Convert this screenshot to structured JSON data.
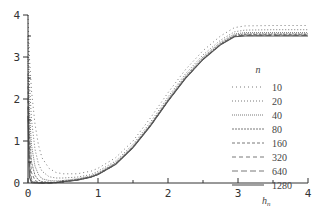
{
  "chart_data": {
    "type": "line",
    "title": "",
    "xlabel": "h_n",
    "ylabel": "",
    "xlim": [
      0,
      4
    ],
    "ylim": [
      0,
      4
    ],
    "xticks": [
      0,
      1,
      2,
      3,
      4
    ],
    "yticks": [
      0,
      1,
      2,
      3,
      4
    ],
    "xtick_labels": [
      "0",
      "1",
      "2",
      "3",
      "4"
    ],
    "ytick_labels": [
      "0",
      "1",
      "2",
      "3",
      "4"
    ],
    "minor_ticks": true,
    "grid": false,
    "legend": {
      "title": "n",
      "position": "right-center"
    },
    "x": [
      0.0,
      0.02,
      0.05,
      0.1,
      0.15,
      0.2,
      0.3,
      0.4,
      0.5,
      0.7,
      0.9,
      1.0,
      1.25,
      1.5,
      1.75,
      2.0,
      2.25,
      2.5,
      2.75,
      2.95,
      3.1,
      3.5,
      4.0
    ],
    "series": [
      {
        "name": "10",
        "dash": "1,3",
        "values": [
          4.0,
          3.0,
          2.2,
          1.4,
          0.9,
          0.6,
          0.35,
          0.25,
          0.22,
          0.22,
          0.28,
          0.35,
          0.6,
          1.0,
          1.55,
          2.15,
          2.7,
          3.15,
          3.5,
          3.7,
          3.74,
          3.75,
          3.75
        ]
      },
      {
        "name": "20",
        "dash": "1,2",
        "values": [
          3.5,
          2.4,
          1.5,
          0.8,
          0.45,
          0.28,
          0.15,
          0.12,
          0.12,
          0.14,
          0.2,
          0.28,
          0.52,
          0.92,
          1.45,
          2.05,
          2.6,
          3.05,
          3.4,
          3.6,
          3.64,
          3.65,
          3.65
        ]
      },
      {
        "name": "40",
        "dash": "1,1",
        "values": [
          3.0,
          1.7,
          0.9,
          0.4,
          0.2,
          0.1,
          0.06,
          0.05,
          0.06,
          0.1,
          0.17,
          0.24,
          0.48,
          0.88,
          1.4,
          2.0,
          2.55,
          3.0,
          3.35,
          3.55,
          3.58,
          3.58,
          3.58
        ]
      },
      {
        "name": "80",
        "dash": "2,1",
        "values": [
          2.6,
          1.2,
          0.5,
          0.18,
          0.07,
          0.03,
          0.02,
          0.02,
          0.04,
          0.08,
          0.15,
          0.22,
          0.46,
          0.86,
          1.38,
          1.97,
          2.52,
          2.97,
          3.32,
          3.52,
          3.55,
          3.55,
          3.55
        ]
      },
      {
        "name": "160",
        "dash": "3,2",
        "values": [
          2.3,
          0.8,
          0.25,
          0.06,
          0.02,
          0.01,
          0.01,
          0.01,
          0.03,
          0.07,
          0.14,
          0.21,
          0.45,
          0.85,
          1.37,
          1.96,
          2.5,
          2.95,
          3.3,
          3.5,
          3.53,
          3.53,
          3.53
        ]
      },
      {
        "name": "320",
        "dash": "4,3",
        "values": [
          2.0,
          0.5,
          0.1,
          0.02,
          0.01,
          0.0,
          0.0,
          0.01,
          0.03,
          0.07,
          0.14,
          0.2,
          0.44,
          0.84,
          1.36,
          1.95,
          2.49,
          2.94,
          3.29,
          3.49,
          3.52,
          3.52,
          3.52
        ]
      },
      {
        "name": "640",
        "dash": "6,3",
        "values": [
          1.8,
          0.3,
          0.04,
          0.01,
          0.0,
          0.0,
          0.0,
          0.01,
          0.03,
          0.07,
          0.14,
          0.2,
          0.44,
          0.84,
          1.36,
          1.95,
          2.49,
          2.94,
          3.29,
          3.49,
          3.51,
          3.51,
          3.51
        ]
      },
      {
        "name": "1280",
        "dash": "",
        "values": [
          1.6,
          0.15,
          0.01,
          0.0,
          0.0,
          0.0,
          0.0,
          0.01,
          0.03,
          0.07,
          0.14,
          0.2,
          0.44,
          0.84,
          1.36,
          1.95,
          2.49,
          2.94,
          3.29,
          3.48,
          3.5,
          3.5,
          3.5
        ]
      }
    ]
  },
  "plot": {
    "x_axis_title": "h",
    "x_axis_title_sub": "n",
    "legend_title": "n",
    "colors": {
      "axis": "#333333",
      "line": "#555555"
    }
  }
}
